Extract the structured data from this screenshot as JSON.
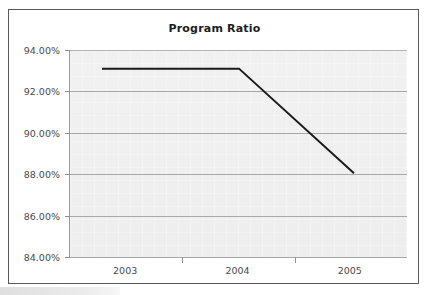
{
  "chart_data": {
    "type": "line",
    "title": "Program Ratio",
    "xlabel": "",
    "ylabel": "",
    "categories": [
      "2003",
      "2004",
      "2005"
    ],
    "values": [
      93.1,
      93.1,
      88.05
    ],
    "series": [
      {
        "name": "Program Ratio",
        "values": [
          93.1,
          93.1,
          88.05
        ]
      }
    ],
    "ylim": [
      84.0,
      94.0
    ],
    "ytick_labels": [
      "94.00%",
      "92.00%",
      "90.00%",
      "88.00%",
      "86.00%",
      "84.00%"
    ],
    "ytick_values": [
      94.0,
      92.0,
      90.0,
      88.0,
      86.0,
      84.0
    ],
    "xtick_labels": [
      "2003",
      "2004",
      "2005"
    ],
    "grid": "horizontal",
    "legend": "none",
    "value_format": "percent",
    "colors": {
      "line": "#1a1a1a",
      "plot_background": "#ededed",
      "gridline": "#a8a8a8",
      "axis": "#8f8f8f",
      "frame_border": "#5a5a5a",
      "title_text": "#1d1d1d",
      "tick_text": "#4a4a4a"
    }
  }
}
